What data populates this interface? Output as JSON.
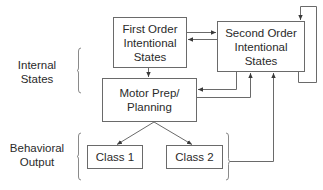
{
  "diagram": {
    "boxes": {
      "first_order": {
        "lines": [
          "First Order",
          "Intentional",
          "States"
        ]
      },
      "second_order": {
        "lines": [
          "Second Order",
          "Intentional",
          "States"
        ]
      },
      "motor": {
        "lines": [
          "Motor Prep/",
          "Planning"
        ]
      },
      "class1": {
        "lines": [
          "Class 1"
        ]
      },
      "class2": {
        "lines": [
          "Class 2"
        ]
      }
    },
    "groups": {
      "internal_states": {
        "lines": [
          "Internal",
          "States"
        ]
      },
      "behavioral_output": {
        "lines": [
          "Behavioral",
          "Output"
        ]
      }
    },
    "colors": {
      "line": "#6a6a6a",
      "text": "#2a2a2a",
      "background": "#ffffff"
    }
  }
}
